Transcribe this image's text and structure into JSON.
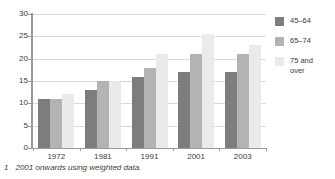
{
  "chart_data": {
    "type": "bar",
    "title": "",
    "subtitle": "",
    "xlabel": "",
    "ylabel": "",
    "categories": [
      "1972",
      "1981",
      "1991",
      "2001",
      "2003"
    ],
    "series": [
      {
        "name": "45–64",
        "color": "#7d7d7d",
        "values": [
          11,
          13,
          16,
          17,
          17
        ]
      },
      {
        "name": "65–74",
        "color": "#b3b3b3",
        "values": [
          11,
          15,
          18,
          21,
          21
        ]
      },
      {
        "name": "75 and\nover",
        "color": "#eaeaea",
        "values": [
          12,
          15,
          21,
          25.5,
          23
        ]
      }
    ],
    "ylim": [
      0,
      30
    ],
    "ytick_values": [
      30,
      25,
      20,
      15,
      10,
      5,
      0
    ],
    "ytick_labels": [
      "30",
      "25",
      "20",
      "15",
      "10",
      "5",
      "0"
    ],
    "grid": true,
    "grid_color": "#d9d9d9",
    "legend_position": "right",
    "axis_color": "#9a9a9a"
  },
  "legend": {
    "items": [
      {
        "label": "45–64",
        "color": "#7d7d7d"
      },
      {
        "label": "65–74",
        "color": "#b3b3b3"
      },
      {
        "label": "75 and\nover",
        "color": "#eaeaea"
      }
    ]
  },
  "footnote": {
    "marker": "1",
    "text": "2001 onwards using weighted data."
  }
}
